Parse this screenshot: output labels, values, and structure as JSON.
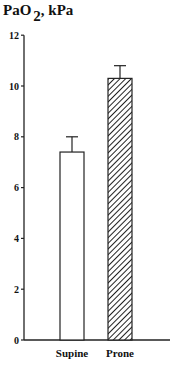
{
  "chart_data": {
    "type": "bar",
    "title": "PaO2, kPa",
    "title_parts": {
      "main": "PaO",
      "subscript": "2",
      "suffix": ", kPa"
    },
    "xlabel": "",
    "ylabel": "PaO2, kPa",
    "categories": [
      "Supine",
      "Prone"
    ],
    "values": [
      7.4,
      10.3
    ],
    "error_upper": [
      8.0,
      10.8
    ],
    "error_bars": [
      0.6,
      0.5
    ],
    "bar_styles": [
      "white",
      "hatched"
    ],
    "ylim": [
      0,
      12
    ],
    "yticks": [
      0,
      2,
      4,
      6,
      8,
      10,
      12
    ],
    "grid": false,
    "legend": null
  }
}
